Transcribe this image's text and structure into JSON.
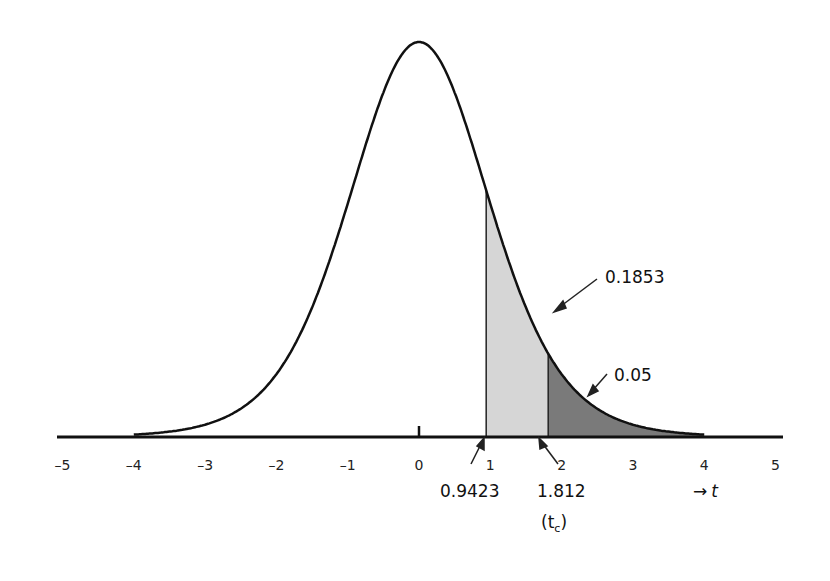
{
  "chart_data": {
    "type": "area",
    "title": "",
    "xlabel": "t",
    "ylabel": "",
    "distribution": "Student t density (bell curve)",
    "xlim": [
      -5,
      5
    ],
    "x_ticks": [
      "-5",
      "-4",
      "-3",
      "-2",
      "-1",
      "0",
      "1",
      "2",
      "3",
      "4",
      "5"
    ],
    "grid": false,
    "shaded_regions": [
      {
        "name": "light-region",
        "from": 0.9423,
        "to": 1.812,
        "color": "#d6d6d6"
      },
      {
        "name": "dark-region",
        "from": 1.812,
        "to": 4,
        "color": "#7a7a7a"
      }
    ],
    "annotations": [
      {
        "text": "0.1853",
        "points_to": "tail area beyond 0.9423"
      },
      {
        "text": "0.05",
        "points_to": "tail area beyond 1.812"
      },
      {
        "text": "0.9423",
        "points_to": "t = 0.9423"
      },
      {
        "text": "1.812",
        "points_to": "t = 1.812"
      },
      {
        "text": "(tc)",
        "meaning": "critical value"
      }
    ],
    "axis_label": "→ t"
  },
  "labels": {
    "area_total": "0.1853",
    "area_tail": "0.05",
    "t_value": "0.9423",
    "t_critical": "1.812",
    "tc_open": "(t",
    "tc_sub": "c",
    "tc_close": ")",
    "axis_arrow": "→",
    "axis_var": "t"
  }
}
